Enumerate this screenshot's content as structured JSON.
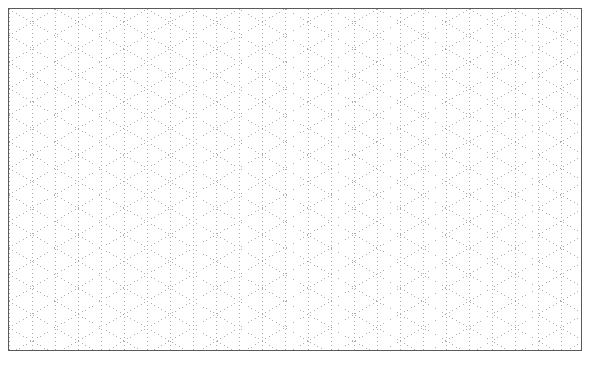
{
  "page": {
    "background_color": "#ffffff",
    "width": 589,
    "height": 369
  },
  "frame": {
    "name": "grid-border",
    "x": 8,
    "y": 8,
    "width": 574,
    "height": 343,
    "border_color": "#5a5a5a",
    "border_width": 1,
    "fill_color": "#ffffff"
  },
  "grid": {
    "type": "isometric-triangular",
    "line_style": "dotted",
    "line_color": "#9a9a9a",
    "line_width": 0.8,
    "dot_length": 1,
    "dot_gap": 3,
    "column_spacing": 23,
    "row_spacing": 39.84,
    "diagonal_angle_degrees": 30,
    "vertical_line_count": 26,
    "families": [
      {
        "name": "vertical-lines",
        "orientation": "vertical",
        "angle_degrees": 90
      },
      {
        "name": "diagonal-lines-down-right",
        "orientation": "diagonal",
        "angle_degrees": 30
      },
      {
        "name": "diagonal-lines-up-right",
        "orientation": "diagonal",
        "angle_degrees": -30
      }
    ]
  }
}
